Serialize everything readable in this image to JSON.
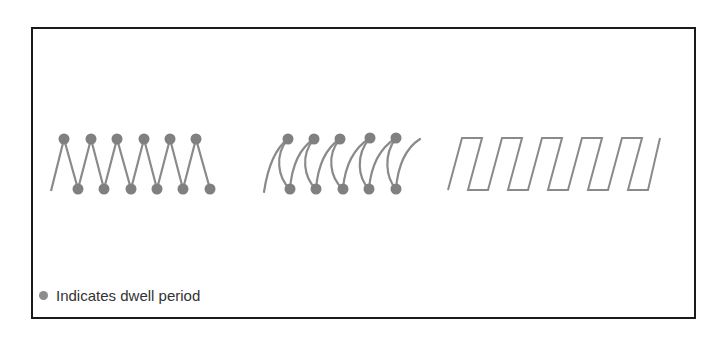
{
  "legend": {
    "label": "Indicates dwell period",
    "marker_color": "#8c8c8c"
  },
  "colors": {
    "line": "#8a8a8a",
    "dot": "#808080",
    "frame": "#1a1a1a"
  },
  "patterns": [
    {
      "name": "zigzag-with-dwell",
      "dwell_points_top": 6,
      "dwell_points_bottom": 6
    },
    {
      "name": "looping-curves-with-dwell",
      "dwell_points_top": 5,
      "dwell_points_bottom": 5
    },
    {
      "name": "square-wave",
      "dwell_points_top": 0,
      "dwell_points_bottom": 0
    }
  ]
}
